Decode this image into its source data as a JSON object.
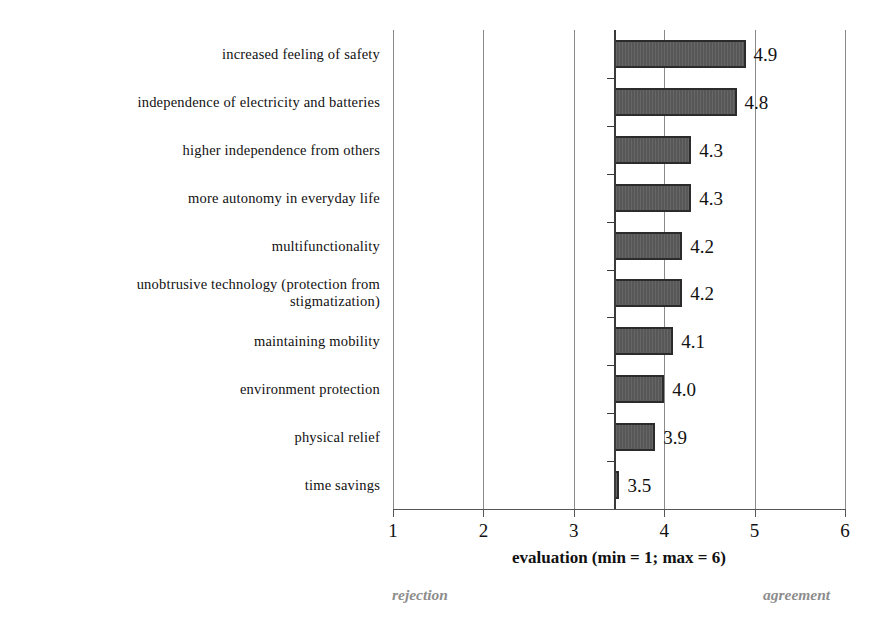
{
  "chart_data": {
    "type": "bar",
    "orientation": "horizontal",
    "title": "",
    "xlabel": "evaluation (min = 1; max = 6)",
    "ylabel": "",
    "xlim": [
      1,
      6
    ],
    "xticks": [
      "1",
      "2",
      "3",
      "4",
      "5",
      "6"
    ],
    "grid": true,
    "bar_baseline": 3.45,
    "legend": "none",
    "categories": [
      "increased feeling of safety",
      "independence of electricity and batteries",
      "higher independence from others",
      "more autonomy in everyday life",
      "multifunctionality",
      "unobtrusive technology (protection from\nstigmatization)",
      "maintaining mobility",
      "environment protection",
      "physical relief",
      "time savings"
    ],
    "values": [
      4.9,
      4.8,
      4.3,
      4.3,
      4.2,
      4.2,
      4.1,
      4.0,
      3.9,
      3.5
    ],
    "value_labels": [
      "4.9",
      "4.8",
      "4.3",
      "4.3",
      "4.2",
      "4.2",
      "4.1",
      "4.0",
      "3.9",
      "3.5"
    ],
    "annotations": {
      "left_anchor": "rejection",
      "right_anchor": "agreement"
    },
    "colors": {
      "bar_fill": "#5c5c5c",
      "bar_border": "#2b2b2b",
      "gridline": "#8a8a8a",
      "axis": "#3a3a3a",
      "text": "#111111",
      "anchor_text": "#8d8d8d",
      "background": "#ffffff"
    }
  }
}
